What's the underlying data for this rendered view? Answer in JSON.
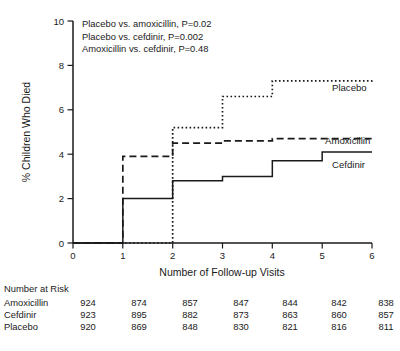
{
  "chart_data": {
    "type": "line",
    "subtype": "step-kaplan-meier",
    "title": "",
    "xlabel": "Number of Follow-up Visits",
    "ylabel": "% Children Who Died",
    "xlim": [
      0,
      6
    ],
    "ylim": [
      0,
      10
    ],
    "xticks": [
      "0",
      "1",
      "2",
      "3",
      "4",
      "5",
      "6"
    ],
    "yticks": [
      "0",
      "2",
      "4",
      "6",
      "8",
      "10"
    ],
    "grid": false,
    "legend_position": "inline-right",
    "x": [
      0,
      1,
      2,
      3,
      4,
      5,
      6
    ],
    "series": [
      {
        "name": "Placebo",
        "style": "dotted",
        "values": [
          0,
          0,
          5.2,
          6.6,
          7.3,
          7.3,
          7.4
        ]
      },
      {
        "name": "Amoxicillin",
        "style": "dashed",
        "values": [
          0,
          3.9,
          4.5,
          4.6,
          4.7,
          4.7,
          4.8
        ]
      },
      {
        "name": "Cefdinir",
        "style": "solid",
        "values": [
          0,
          2.0,
          2.8,
          3.0,
          3.7,
          4.1,
          4.1
        ]
      }
    ],
    "annotations": [
      "Placebo vs. amoxicillin, P=0.02",
      "Placebo vs. cefdinir, P=0.002",
      "Amoxicillin vs. cefdinir, P=0.48"
    ]
  },
  "risk_table": {
    "heading": "Number at Risk",
    "rows": [
      {
        "label": "Amoxicillin",
        "values": [
          "924",
          "874",
          "857",
          "847",
          "844",
          "842",
          "838"
        ]
      },
      {
        "label": "Cefdinir",
        "values": [
          "923",
          "895",
          "882",
          "873",
          "863",
          "860",
          "857"
        ]
      },
      {
        "label": "Placebo",
        "values": [
          "920",
          "869",
          "848",
          "830",
          "821",
          "816",
          "811"
        ]
      }
    ]
  }
}
